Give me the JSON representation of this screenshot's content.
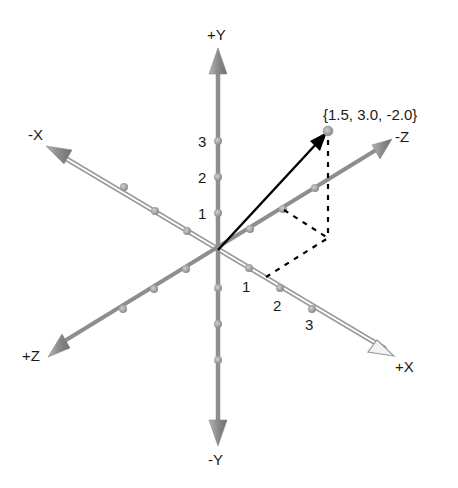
{
  "diagram": {
    "origin_px": [
      218,
      250
    ],
    "colors": {
      "axis": "#8e8e8e",
      "axis_dark": "#7a7a7a",
      "x_axis_fill": "#ffffff",
      "tick_dot": "#9a9a9a",
      "vector": "#000000",
      "dashed": "#000000",
      "label": "#1a1a1a"
    },
    "axes": {
      "y_pos": {
        "label": "+Y"
      },
      "y_neg": {
        "label": "-Y"
      },
      "x_pos": {
        "label": "+X"
      },
      "x_neg": {
        "label": "-X"
      },
      "z_pos": {
        "label": "+Z"
      },
      "z_neg": {
        "label": "-Z"
      }
    },
    "tick_labels": {
      "y": [
        "1",
        "2",
        "3"
      ],
      "x": [
        "1",
        "2",
        "3"
      ]
    },
    "point": {
      "label": "{1.5, 3.0, -2.0}",
      "coords": [
        1.5,
        3.0,
        -2.0
      ]
    }
  }
}
